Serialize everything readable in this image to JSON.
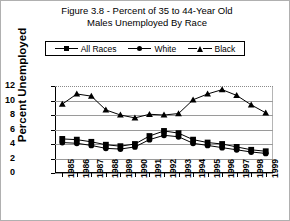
{
  "chart": {
    "title_line1": "Figure 3.8 - Percent of 35 to 44-Year Old",
    "title_line2": "Males Unemployed By Race",
    "ylabel": "Percent Unemployed"
  },
  "legend": {
    "items": [
      {
        "label": "All Races",
        "marker": "square-marker"
      },
      {
        "label": "White",
        "marker": "circle-marker"
      },
      {
        "label": "Black",
        "marker": "triangle-marker"
      }
    ]
  },
  "chart_data": {
    "type": "line",
    "title": "Figure 3.8 - Percent of 35 to 44-Year Old Males Unemployed By Race",
    "xlabel": "",
    "ylabel": "Percent Unemployed",
    "ylim": [
      0,
      12
    ],
    "yticks": [
      0,
      2,
      4,
      6,
      8,
      10,
      12
    ],
    "grid": true,
    "legend_position": "top",
    "categories": [
      "1985",
      "1986",
      "1987",
      "1988",
      "1989",
      "1990",
      "1991",
      "1992",
      "1993",
      "1994",
      "1995",
      "1996",
      "1997",
      "1998",
      "1999"
    ],
    "series": [
      {
        "name": "All Races",
        "marker": "square",
        "values": [
          4.7,
          4.6,
          4.3,
          3.9,
          3.7,
          4.0,
          5.1,
          5.8,
          5.5,
          4.6,
          4.2,
          4.0,
          3.6,
          3.2,
          3.0
        ]
      },
      {
        "name": "White",
        "marker": "circle",
        "values": [
          4.2,
          4.1,
          3.8,
          3.4,
          3.3,
          3.6,
          4.6,
          5.2,
          5.0,
          4.1,
          3.8,
          3.5,
          3.2,
          2.9,
          2.7
        ]
      },
      {
        "name": "Black",
        "marker": "triangle",
        "values": [
          9.5,
          10.9,
          10.6,
          8.7,
          8.0,
          7.6,
          8.1,
          8.0,
          8.2,
          10.1,
          10.9,
          11.5,
          10.7,
          9.4,
          8.3
        ]
      }
    ]
  }
}
